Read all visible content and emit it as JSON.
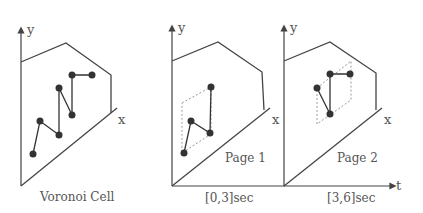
{
  "panels": [
    {
      "id": "voronoi",
      "caption": "Voronoi Cell",
      "y_label": "y",
      "x_label": "x"
    },
    {
      "id": "page1",
      "caption": "[0,3]sec",
      "page_label": "Page 1",
      "y_label": "y",
      "x_label": "x"
    },
    {
      "id": "page2",
      "caption": "[3,6]sec",
      "page_label": "Page 2",
      "y_label": "y",
      "x_label": "x"
    }
  ],
  "t_label": "t",
  "colors": {
    "line": "#444444",
    "dot": "#333333",
    "dashed": "#999999",
    "text": "#555555"
  }
}
